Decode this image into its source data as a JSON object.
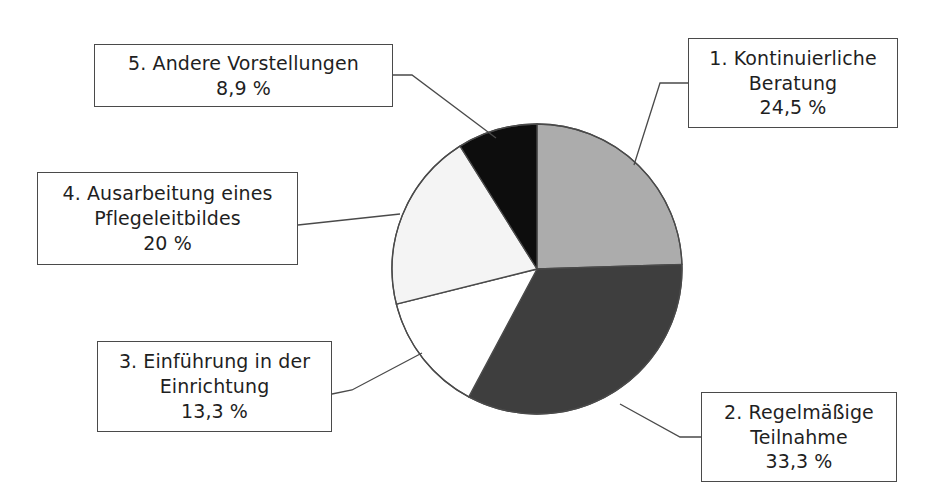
{
  "chart_data": {
    "type": "pie",
    "title": "",
    "subtitle": "",
    "xlabel": "",
    "ylabel": "",
    "legend_position": "callouts-around-pie",
    "grid": false,
    "start_angle_deg": 0,
    "direction": "clockwise",
    "units": "percent",
    "decimal_separator": ",",
    "categories": [
      "1. Kontinuierliche Beratung",
      "2. Regelmäßige Teilnahme",
      "3. Einführung in der Einrichtung",
      "4. Ausarbeitung eines Pflegeleitbildes",
      "5. Andere Vorstellungen"
    ],
    "values": [
      24.5,
      33.3,
      13.3,
      20,
      8.9
    ],
    "value_labels": [
      "24,5 %",
      "33,3 %",
      "13,3 %",
      "20 %",
      "8,9 %"
    ],
    "colors": [
      "#ACACAC",
      "#3E3E3E",
      "#FFFFFF",
      "#F4F4F4",
      "#0D0D0D"
    ],
    "slices": [
      {
        "index": 1,
        "label": "1. Kontinuierliche Beratung",
        "value": 24.5,
        "value_label": "24,5 %",
        "color": "#ACACAC",
        "start_deg": 0,
        "end_deg": 88.2
      },
      {
        "index": 2,
        "label": "2. Regelmäßige Teilnahme",
        "value": 33.3,
        "value_label": "33,3 %",
        "color": "#3E3E3E",
        "start_deg": 88.2,
        "end_deg": 208.08
      },
      {
        "index": 3,
        "label": "3. Einführung in der Einrichtung",
        "value": 13.3,
        "value_label": "13,3 %",
        "color": "#FFFFFF",
        "start_deg": 208.08,
        "end_deg": 255.96
      },
      {
        "index": 4,
        "label": "4. Ausarbeitung eines Pflegeleitbildes",
        "value": 20,
        "value_label": "20 %",
        "color": "#F4F4F4",
        "start_deg": 255.96,
        "end_deg": 327.96
      },
      {
        "index": 5,
        "label": "5. Andere Vorstellungen",
        "value": 8.9,
        "value_label": "8,9 %",
        "color": "#0D0D0D",
        "start_deg": 327.96,
        "end_deg": 360
      }
    ]
  },
  "callouts": {
    "c1": {
      "line1": "1. Kontinuierliche",
      "line2": "Beratung",
      "pct": "24,5 %"
    },
    "c2": {
      "line1": "2. Regelmäßige",
      "line2": "Teilnahme",
      "pct": "33,3 %"
    },
    "c3": {
      "line1": "3. Einführung in der",
      "line2": "Einrichtung",
      "pct": "13,3 %"
    },
    "c4": {
      "line1": "4. Ausarbeitung eines",
      "line2": "Pflegeleitbildes",
      "pct": "20 %"
    },
    "c5": {
      "line1": "5. Andere Vorstellungen",
      "line2": "",
      "pct": "8,9 %"
    }
  },
  "colors": {
    "slice_1": "#ACACAC",
    "slice_2": "#3E3E3E",
    "slice_3": "#FFFFFF",
    "slice_4": "#F4F4F4",
    "slice_5": "#0D0D0D",
    "outline": "#4A4A4A",
    "background": "#FFFFFF",
    "text": "#1F1F1F"
  }
}
